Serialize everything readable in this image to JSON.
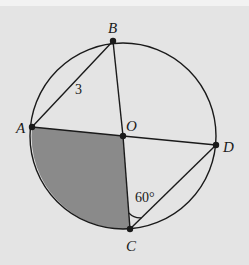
{
  "figure": {
    "circle": {
      "cx": 123,
      "cy": 136,
      "r": 93
    },
    "points": {
      "A": {
        "x": 32,
        "y": 127
      },
      "B": {
        "x": 113,
        "y": 41
      },
      "O": {
        "x": 123,
        "y": 136
      },
      "C": {
        "x": 130,
        "y": 229
      },
      "D": {
        "x": 216,
        "y": 145
      }
    },
    "labels": {
      "A": "A",
      "B": "B",
      "O": "O",
      "C": "C",
      "D": "D",
      "side_AB": "3",
      "angle_OCD": "60°"
    },
    "colors": {
      "background": "#e4e4e4",
      "shaded_sector": "#8a8a8a",
      "stroke": "#1a1a1a"
    },
    "segments": [
      "AB",
      "BO",
      "OC",
      "AO",
      "OD",
      "CD"
    ],
    "shaded_region": "sector AOC"
  }
}
